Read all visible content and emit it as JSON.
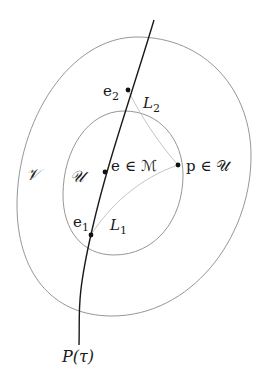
{
  "diagram": {
    "type": "geometric-sets-and-curve",
    "curve_label": "P(τ)",
    "regions": {
      "outer": {
        "label": "𝒱",
        "name": "V"
      },
      "inner": {
        "label": "𝒰",
        "name": "U"
      }
    },
    "points": {
      "e2": {
        "label_base": "e",
        "label_sub": "2"
      },
      "e": {
        "label": "e ∈ ℳ"
      },
      "e1": {
        "label_base": "e",
        "label_sub": "1"
      },
      "p": {
        "label": "p ∈ 𝒰"
      }
    },
    "connections": {
      "L2": {
        "label_base": "L",
        "label_sub": "2",
        "from": "e2",
        "to": "p"
      },
      "L1": {
        "label_base": "L",
        "label_sub": "1",
        "from": "e1",
        "to": "p"
      }
    },
    "colors": {
      "curve": "#1a1a1a",
      "region_outline": "#8a8a8a",
      "connection_line": "#bdbdbd",
      "point": "#111111",
      "background": "#ffffff"
    }
  }
}
